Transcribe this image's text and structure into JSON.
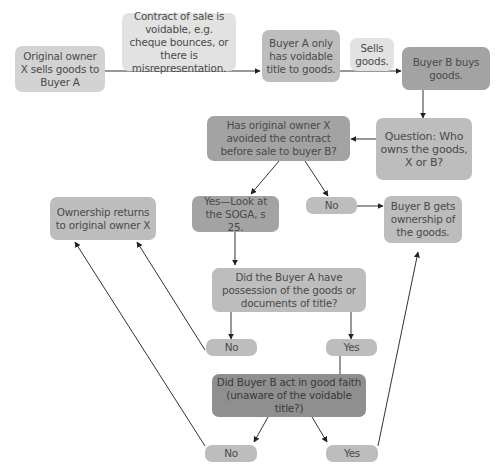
{
  "diagram": {
    "type": "flowchart",
    "colors": {
      "lightest": "#e2e2e2",
      "light": "#d3d3d3",
      "medium": "#bdbdbd",
      "dark": "#a3a3a3",
      "darkest": "#8f8f8f",
      "line": "#333333",
      "text": "#4a4a4a"
    },
    "nodes": {
      "original_owner": "Original owner X sells goods to Buyer A",
      "contract_voidable": "Contract of sale is voidable, e.g. cheque bounces, or there is misrepresentation.",
      "buyer_a_voidable": "Buyer A only has voidable title to goods.",
      "sells_goods": "Sells goods.",
      "buyer_b_buys": "Buyer B buys goods.",
      "question": "Question: Who owns the goods, X or B?",
      "avoided_contract": "Has original owner X avoided the contract before sale to buyer B?",
      "yes_soga": "Yes—Look at the SOGA, s 25.",
      "no_1": "No",
      "buyer_b_gets": "Buyer B gets ownership of the goods.",
      "ownership_returns": "Ownership returns to original owner X",
      "possession_question": "Did the Buyer A have possession of the goods or documents of title?",
      "no_2": "No",
      "yes_2": "Yes",
      "good_faith": "Did Buyer B act in good faith (unaware of the voidable title?)",
      "no_3": "No",
      "yes_3": "Yes"
    }
  }
}
